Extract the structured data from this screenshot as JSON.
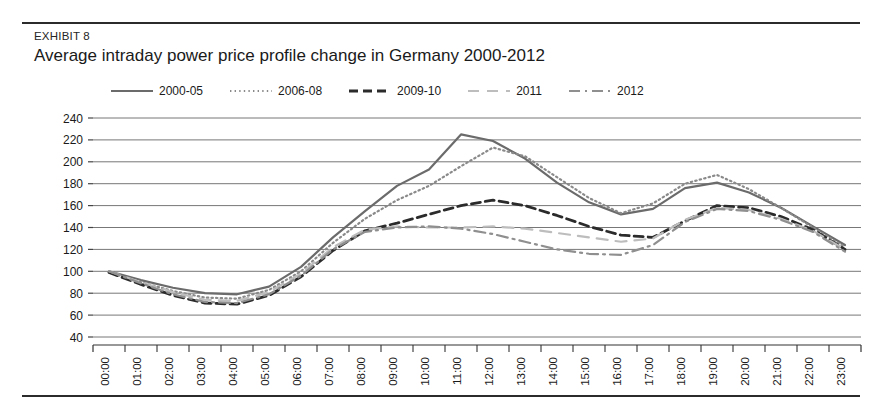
{
  "exhibit": {
    "label": "EXHIBIT 8",
    "title": "Average intraday power price profile change in Germany 2000-2012"
  },
  "chart_data": {
    "type": "line",
    "title": "Average intraday power price profile change in Germany 2000-2012",
    "xlabel": "",
    "ylabel": "",
    "ylim": [
      40,
      240
    ],
    "ytick_step": 20,
    "yticks": [
      40,
      60,
      80,
      100,
      120,
      140,
      160,
      180,
      200,
      220,
      240
    ],
    "grid": true,
    "legend_position": "top",
    "categories": [
      "00:00",
      "01:00",
      "02:00",
      "03:00",
      "04:00",
      "05:00",
      "06:00",
      "07:00",
      "08:00",
      "09:00",
      "10:00",
      "11:00",
      "12:00",
      "13:00",
      "14:00",
      "15:00",
      "16:00",
      "17:00",
      "18:00",
      "19:00",
      "20:00",
      "21:00",
      "22:00",
      "23:00"
    ],
    "series": [
      {
        "name": "2000-05",
        "style": "solid",
        "color": "#6b6b6b",
        "width": 2.2,
        "values": [
          100,
          92,
          85,
          80,
          79,
          86,
          104,
          131,
          155,
          178,
          193,
          225,
          219,
          203,
          181,
          163,
          152,
          157,
          176,
          181,
          172,
          158,
          141,
          124
        ]
      },
      {
        "name": "2006-08",
        "style": "dotted",
        "color": "#8a8a8a",
        "width": 2.2,
        "values": [
          99,
          90,
          82,
          76,
          75,
          83,
          100,
          126,
          148,
          165,
          178,
          196,
          213,
          205,
          186,
          167,
          153,
          162,
          180,
          188,
          175,
          158,
          140,
          122
        ]
      },
      {
        "name": "2009-10",
        "style": "dashed",
        "color": "#2b2b2b",
        "width": 2.8,
        "values": [
          99,
          88,
          78,
          71,
          70,
          78,
          95,
          119,
          137,
          144,
          152,
          160,
          165,
          160,
          151,
          141,
          133,
          131,
          146,
          160,
          158,
          150,
          138,
          120
        ]
      },
      {
        "name": "2011",
        "style": "longdash",
        "color": "#bdbdbd",
        "width": 2.2,
        "values": [
          100,
          90,
          81,
          74,
          73,
          81,
          98,
          122,
          138,
          141,
          140,
          140,
          141,
          139,
          135,
          131,
          127,
          130,
          147,
          158,
          156,
          148,
          137,
          120
        ]
      },
      {
        "name": "2012",
        "style": "dashdot",
        "color": "#8f8f8f",
        "width": 2.2,
        "values": [
          100,
          89,
          79,
          72,
          71,
          79,
          96,
          120,
          136,
          140,
          141,
          139,
          134,
          127,
          120,
          116,
          115,
          124,
          145,
          157,
          155,
          147,
          136,
          118
        ]
      }
    ]
  }
}
